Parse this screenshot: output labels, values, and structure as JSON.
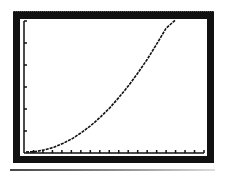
{
  "chart_data": {
    "type": "line",
    "title": "",
    "xlabel": "",
    "ylabel": "",
    "x_ticks": 19,
    "y_ticks": 6,
    "grid": false,
    "legend": null,
    "xlim": [
      0,
      19
    ],
    "ylim": [
      0,
      6
    ],
    "x": [
      0,
      1,
      2,
      3,
      4,
      5,
      6,
      7,
      8,
      9,
      10,
      11,
      12,
      13,
      14,
      15,
      16
    ],
    "series": [
      {
        "name": "curve",
        "values": [
          0.0,
          0.02,
          0.1,
          0.22,
          0.4,
          0.62,
          0.9,
          1.22,
          1.6,
          2.02,
          2.5,
          3.02,
          3.6,
          4.22,
          4.9,
          5.62,
          6.0
        ]
      }
    ]
  },
  "colors": {
    "frame": "#111111",
    "screen": "#ffffff",
    "curve": "#111111"
  }
}
